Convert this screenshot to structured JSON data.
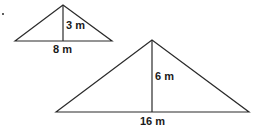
{
  "figures": {
    "small_triangle": {
      "height_label": "3 m",
      "base_label": "8 m"
    },
    "large_triangle": {
      "height_label": "6 m",
      "base_label": "16 m"
    }
  },
  "colors": {
    "stroke": "#2a2a2a",
    "background": "#ffffff"
  }
}
